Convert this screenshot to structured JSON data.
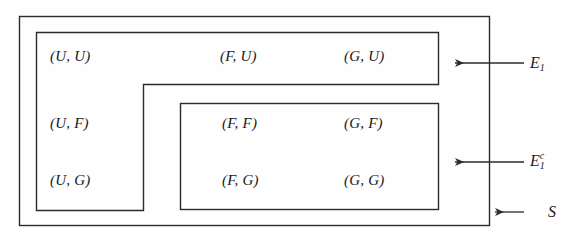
{
  "figure": {
    "type": "set-partition-diagram",
    "background_color": "#fefefe",
    "line_color": "#2b2b2b"
  },
  "cells": [
    {
      "id": "u-u",
      "text": "(U, U)",
      "x": 50,
      "y": 48,
      "region": "E1"
    },
    {
      "id": "f-u",
      "text": "(F, U)",
      "x": 220,
      "y": 48,
      "region": "E1"
    },
    {
      "id": "g-u",
      "text": "(G, U)",
      "x": 344,
      "y": 48,
      "region": "E1"
    },
    {
      "id": "u-f",
      "text": "(U, F)",
      "x": 50,
      "y": 115,
      "region": "E1"
    },
    {
      "id": "f-f",
      "text": "(F, F)",
      "x": 222,
      "y": 115,
      "region": "E1c"
    },
    {
      "id": "g-f",
      "text": "(G, F)",
      "x": 344,
      "y": 115,
      "region": "E1c"
    },
    {
      "id": "u-g",
      "text": "(U, G)",
      "x": 50,
      "y": 172,
      "region": "E1"
    },
    {
      "id": "f-g",
      "text": "(F, G)",
      "x": 222,
      "y": 172,
      "region": "E1c"
    },
    {
      "id": "g-g",
      "text": "(G, G)",
      "x": 344,
      "y": 172,
      "region": "E1c"
    }
  ],
  "regions": {
    "outer": {
      "name": "S",
      "label_base": "S",
      "label_sub": "",
      "label_sup": "",
      "label_x": 548,
      "label_y": 203,
      "arrow": {
        "x1": 524,
        "y1": 212,
        "x2": 492,
        "y2": 212
      }
    },
    "event": {
      "name": "E1",
      "label_base": "E",
      "label_sub": "1",
      "label_sup": "",
      "label_x": 530,
      "label_y": 54,
      "arrow": {
        "x1": 524,
        "y1": 63,
        "x2": 452,
        "y2": 63
      }
    },
    "complement": {
      "name": "E1c",
      "label_base": "E",
      "label_sub": "1",
      "label_sup": "c",
      "label_x": 530,
      "label_y": 152,
      "arrow": {
        "x1": 524,
        "y1": 162,
        "x2": 452,
        "y2": 162
      }
    }
  },
  "shapes": {
    "outer_box": {
      "x": 19,
      "y": 16,
      "w": 470,
      "h": 209
    },
    "event_polygon_points": "36,32 438,32 438,84 143,84 143,210 36,210",
    "complement_box": {
      "x": 180,
      "y": 103,
      "w": 258,
      "h": 106
    }
  }
}
